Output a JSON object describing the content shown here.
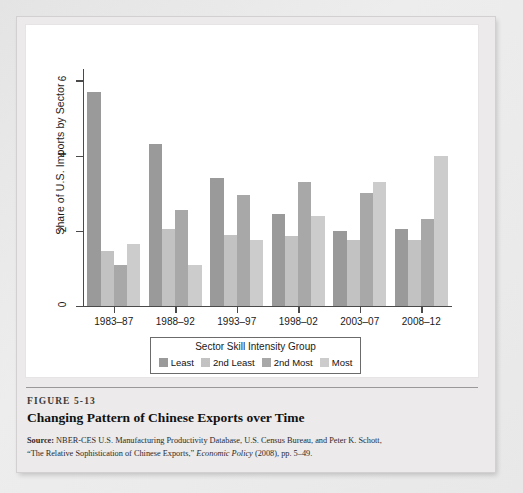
{
  "figure": {
    "number_label": "FIGURE 5-13",
    "title": "Changing Pattern of Chinese Exports over Time",
    "source_prefix": "Source:",
    "source_line1": " NBER-CES U.S. Manufacturing Productivity Database, U.S. Census Bureau, and Peter K. Schott,",
    "source_line2_pre": "“The Relative Sophistication of Chinese Exports,” ",
    "source_line2_italic": "Economic Policy",
    "source_line2_post": " (2008), pp. 5–49."
  },
  "legend": {
    "title": "Sector Skill Intensity Group",
    "items": [
      {
        "label": "Least",
        "color": "#9a9a9a"
      },
      {
        "label": "2nd Least",
        "color": "#c2c2c2"
      },
      {
        "label": "2nd Most",
        "color": "#a8a8a8"
      },
      {
        "label": "Most",
        "color": "#cccccc"
      }
    ]
  },
  "chart_data": {
    "type": "bar",
    "title": "Changing Pattern of Chinese Exports over Time",
    "xlabel": "",
    "ylabel": "Share of U.S. Imports by Sector",
    "categories": [
      "1983–87",
      "1988–92",
      "1993–97",
      "1998–02",
      "2003–07",
      "2008–12"
    ],
    "yticks": [
      0,
      2,
      4,
      6
    ],
    "ylim": [
      0,
      6.3
    ],
    "grid": false,
    "legend_position": "below-axis",
    "series": [
      {
        "name": "Least",
        "color": "#9a9a9a",
        "values": [
          5.7,
          4.3,
          3.4,
          2.45,
          2.0,
          2.05
        ]
      },
      {
        "name": "2nd Least",
        "color": "#c2c2c2",
        "values": [
          1.45,
          2.05,
          1.9,
          1.85,
          1.75,
          1.75
        ]
      },
      {
        "name": "2nd Most",
        "color": "#a8a8a8",
        "values": [
          1.1,
          2.55,
          2.95,
          3.3,
          3.0,
          2.3
        ]
      },
      {
        "name": "Most",
        "color": "#cccccc",
        "values": [
          1.65,
          1.1,
          1.75,
          2.4,
          3.3,
          4.0
        ]
      }
    ]
  }
}
